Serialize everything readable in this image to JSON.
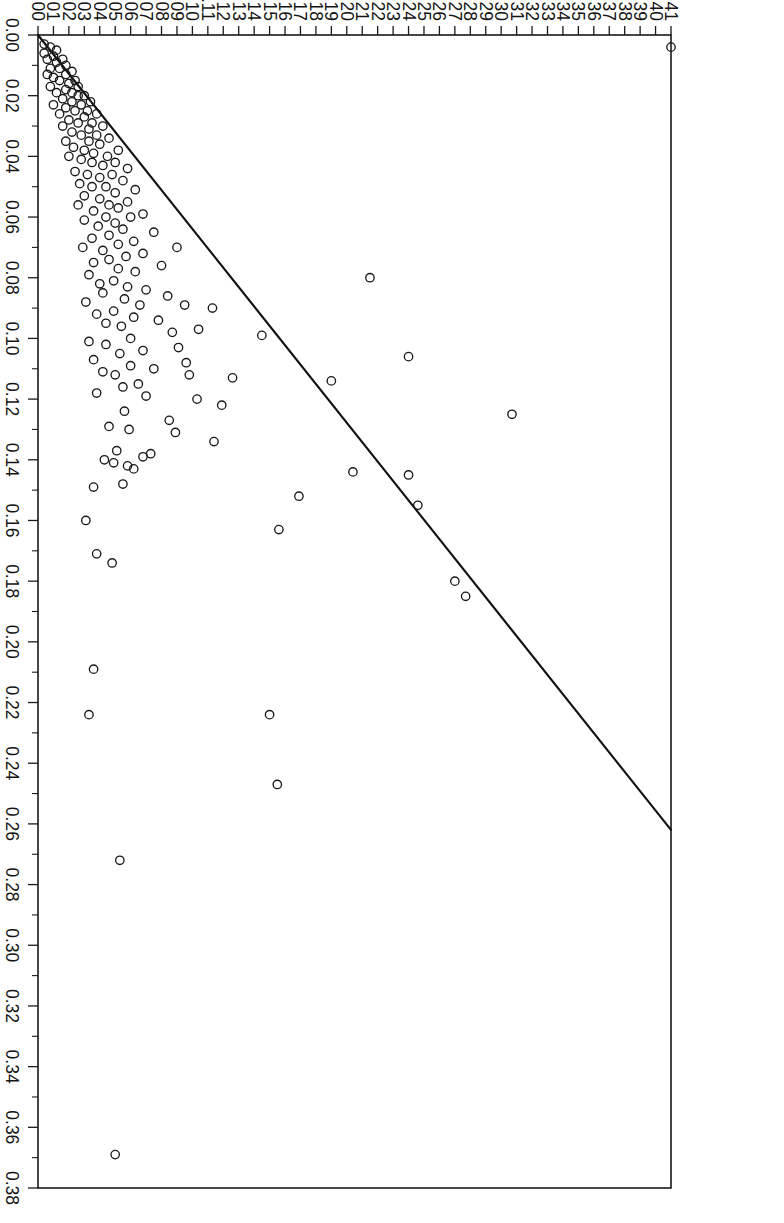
{
  "figure": {
    "background_color": "#ffffff",
    "foreground_color": "#1a1a1a",
    "page_width": 784,
    "page_height": 1223,
    "rotation_degrees": 90,
    "point_symbol": "open-circle"
  },
  "chart_data": {
    "type": "scatter",
    "title": "",
    "subtitle": "",
    "xlabel": "Wife's Average Distress",
    "ylabel": "Husband's Average Distress",
    "xlim": [
      0.0,
      0.38
    ],
    "ylim": [
      0.0,
      0.41
    ],
    "grid": false,
    "legend": null,
    "legend_position": "none",
    "x_major_step": 0.02,
    "x_minor_step": 0.01,
    "y_major_step": 0.01,
    "x_tick_labels": [
      "0.00",
      "0.02",
      "0.04",
      "0.06",
      "0.08",
      "0.10",
      "0.12",
      "0.14",
      "0.16",
      "0.18",
      "0.20",
      "0.22",
      "0.24",
      "0.26",
      "0.28",
      "0.30",
      "0.32",
      "0.34",
      "0.36",
      "0.38"
    ],
    "x_tick_values": [
      0.0,
      0.02,
      0.04,
      0.06,
      0.08,
      0.1,
      0.12,
      0.14,
      0.16,
      0.18,
      0.2,
      0.22,
      0.24,
      0.26,
      0.28,
      0.3,
      0.32,
      0.34,
      0.36,
      0.38
    ],
    "y_tick_labels": [
      "0.00",
      "0.01",
      "0.02",
      "0.03",
      "0.04",
      "0.05",
      "0.06",
      "0.07",
      "0.08",
      "0.09",
      "0.10",
      "0.11",
      "0.12",
      "0.13",
      "0.14",
      "0.15",
      "0.16",
      "0.17",
      "0.18",
      "0.19",
      "0.20",
      "0.21",
      "0.22",
      "0.23",
      "0.24",
      "0.25",
      "0.26",
      "0.27",
      "0.28",
      "0.29",
      "0.30",
      "0.31",
      "0.32",
      "0.33",
      "0.34",
      "0.35",
      "0.36",
      "0.37",
      "0.38",
      "0.39",
      "0.40",
      "0.41"
    ],
    "y_tick_values": [
      0.0,
      0.01,
      0.02,
      0.03,
      0.04,
      0.05,
      0.06,
      0.07,
      0.08,
      0.09,
      0.1,
      0.11,
      0.12,
      0.13,
      0.14,
      0.15,
      0.16,
      0.17,
      0.18,
      0.19,
      0.2,
      0.21,
      0.22,
      0.23,
      0.24,
      0.25,
      0.26,
      0.27,
      0.28,
      0.29,
      0.3,
      0.31,
      0.32,
      0.33,
      0.34,
      0.35,
      0.36,
      0.37,
      0.38,
      0.39,
      0.4,
      0.41
    ],
    "fit_line": {
      "kind": "linear-fit",
      "x_start": 0.0,
      "y_start": 0.0,
      "x_end": 0.262,
      "y_end": 0.41,
      "slope": 1.565,
      "intercept": 0.0
    },
    "series": [
      {
        "name": "couples",
        "marker": "open-circle",
        "n": 171,
        "points": [
          [
            0.004,
            0.41
          ],
          [
            0.369,
            0.05
          ],
          [
            0.272,
            0.053
          ],
          [
            0.247,
            0.155
          ],
          [
            0.224,
            0.15
          ],
          [
            0.224,
            0.033
          ],
          [
            0.209,
            0.036
          ],
          [
            0.185,
            0.277
          ],
          [
            0.18,
            0.27
          ],
          [
            0.174,
            0.048
          ],
          [
            0.171,
            0.038
          ],
          [
            0.163,
            0.156
          ],
          [
            0.16,
            0.031
          ],
          [
            0.155,
            0.246
          ],
          [
            0.152,
            0.169
          ],
          [
            0.149,
            0.036
          ],
          [
            0.148,
            0.055
          ],
          [
            0.145,
            0.24
          ],
          [
            0.144,
            0.204
          ],
          [
            0.143,
            0.062
          ],
          [
            0.142,
            0.058
          ],
          [
            0.141,
            0.049
          ],
          [
            0.14,
            0.043
          ],
          [
            0.139,
            0.068
          ],
          [
            0.138,
            0.073
          ],
          [
            0.137,
            0.051
          ],
          [
            0.134,
            0.114
          ],
          [
            0.131,
            0.089
          ],
          [
            0.13,
            0.059
          ],
          [
            0.129,
            0.046
          ],
          [
            0.127,
            0.085
          ],
          [
            0.125,
            0.307
          ],
          [
            0.124,
            0.056
          ],
          [
            0.122,
            0.119
          ],
          [
            0.12,
            0.103
          ],
          [
            0.119,
            0.07
          ],
          [
            0.118,
            0.038
          ],
          [
            0.116,
            0.055
          ],
          [
            0.115,
            0.065
          ],
          [
            0.114,
            0.19
          ],
          [
            0.113,
            0.126
          ],
          [
            0.112,
            0.098
          ],
          [
            0.112,
            0.05
          ],
          [
            0.111,
            0.042
          ],
          [
            0.11,
            0.075
          ],
          [
            0.109,
            0.06
          ],
          [
            0.108,
            0.096
          ],
          [
            0.107,
            0.036
          ],
          [
            0.106,
            0.24
          ],
          [
            0.105,
            0.053
          ],
          [
            0.104,
            0.068
          ],
          [
            0.103,
            0.091
          ],
          [
            0.102,
            0.044
          ],
          [
            0.101,
            0.033
          ],
          [
            0.1,
            0.06
          ],
          [
            0.099,
            0.145
          ],
          [
            0.098,
            0.087
          ],
          [
            0.097,
            0.104
          ],
          [
            0.096,
            0.054
          ],
          [
            0.095,
            0.044
          ],
          [
            0.094,
            0.078
          ],
          [
            0.093,
            0.062
          ],
          [
            0.092,
            0.038
          ],
          [
            0.091,
            0.049
          ],
          [
            0.09,
            0.113
          ],
          [
            0.089,
            0.095
          ],
          [
            0.089,
            0.066
          ],
          [
            0.088,
            0.031
          ],
          [
            0.087,
            0.056
          ],
          [
            0.086,
            0.084
          ],
          [
            0.085,
            0.042
          ],
          [
            0.084,
            0.07
          ],
          [
            0.083,
            0.058
          ],
          [
            0.082,
            0.04
          ],
          [
            0.081,
            0.049
          ],
          [
            0.08,
            0.215
          ],
          [
            0.079,
            0.033
          ],
          [
            0.078,
            0.063
          ],
          [
            0.077,
            0.052
          ],
          [
            0.076,
            0.08
          ],
          [
            0.075,
            0.036
          ],
          [
            0.074,
            0.046
          ],
          [
            0.073,
            0.057
          ],
          [
            0.072,
            0.068
          ],
          [
            0.071,
            0.042
          ],
          [
            0.07,
            0.029
          ],
          [
            0.07,
            0.09
          ],
          [
            0.069,
            0.052
          ],
          [
            0.068,
            0.062
          ],
          [
            0.067,
            0.035
          ],
          [
            0.066,
            0.046
          ],
          [
            0.065,
            0.075
          ],
          [
            0.064,
            0.055
          ],
          [
            0.063,
            0.039
          ],
          [
            0.062,
            0.05
          ],
          [
            0.061,
            0.03
          ],
          [
            0.06,
            0.06
          ],
          [
            0.06,
            0.044
          ],
          [
            0.059,
            0.068
          ],
          [
            0.058,
            0.036
          ],
          [
            0.057,
            0.052
          ],
          [
            0.056,
            0.026
          ],
          [
            0.056,
            0.046
          ],
          [
            0.055,
            0.058
          ],
          [
            0.054,
            0.04
          ],
          [
            0.053,
            0.03
          ],
          [
            0.052,
            0.05
          ],
          [
            0.051,
            0.063
          ],
          [
            0.05,
            0.035
          ],
          [
            0.05,
            0.044
          ],
          [
            0.049,
            0.027
          ],
          [
            0.048,
            0.055
          ],
          [
            0.047,
            0.04
          ],
          [
            0.046,
            0.048
          ],
          [
            0.046,
            0.032
          ],
          [
            0.045,
            0.024
          ],
          [
            0.044,
            0.058
          ],
          [
            0.043,
            0.042
          ],
          [
            0.042,
            0.035
          ],
          [
            0.042,
            0.05
          ],
          [
            0.041,
            0.028
          ],
          [
            0.04,
            0.02
          ],
          [
            0.04,
            0.045
          ],
          [
            0.039,
            0.036
          ],
          [
            0.038,
            0.03
          ],
          [
            0.038,
            0.052
          ],
          [
            0.037,
            0.023
          ],
          [
            0.036,
            0.04
          ],
          [
            0.035,
            0.033
          ],
          [
            0.035,
            0.018
          ],
          [
            0.034,
            0.046
          ],
          [
            0.033,
            0.028
          ],
          [
            0.033,
            0.038
          ],
          [
            0.032,
            0.022
          ],
          [
            0.031,
            0.033
          ],
          [
            0.03,
            0.016
          ],
          [
            0.03,
            0.042
          ],
          [
            0.029,
            0.026
          ],
          [
            0.029,
            0.035
          ],
          [
            0.028,
            0.02
          ],
          [
            0.027,
            0.03
          ],
          [
            0.026,
            0.014
          ],
          [
            0.026,
            0.038
          ],
          [
            0.025,
            0.024
          ],
          [
            0.025,
            0.032
          ],
          [
            0.024,
            0.018
          ],
          [
            0.023,
            0.028
          ],
          [
            0.023,
            0.01
          ],
          [
            0.022,
            0.022
          ],
          [
            0.022,
            0.034
          ],
          [
            0.021,
            0.016
          ],
          [
            0.02,
            0.026
          ],
          [
            0.02,
            0.03
          ],
          [
            0.019,
            0.012
          ],
          [
            0.019,
            0.022
          ],
          [
            0.018,
            0.018
          ],
          [
            0.017,
            0.026
          ],
          [
            0.017,
            0.008
          ],
          [
            0.016,
            0.02
          ],
          [
            0.015,
            0.014
          ],
          [
            0.015,
            0.024
          ],
          [
            0.014,
            0.01
          ],
          [
            0.013,
            0.018
          ],
          [
            0.013,
            0.006
          ],
          [
            0.012,
            0.022
          ],
          [
            0.011,
            0.014
          ],
          [
            0.011,
            0.008
          ],
          [
            0.01,
            0.018
          ],
          [
            0.009,
            0.012
          ],
          [
            0.008,
            0.006
          ],
          [
            0.008,
            0.016
          ],
          [
            0.007,
            0.01
          ],
          [
            0.006,
            0.004
          ],
          [
            0.005,
            0.012
          ],
          [
            0.004,
            0.008
          ],
          [
            0.003,
            0.004
          ]
        ]
      }
    ]
  }
}
